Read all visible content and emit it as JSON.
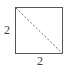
{
  "figure": {
    "name": "square-with-diagonal",
    "background_color": "#ffffff",
    "shape": {
      "type": "square",
      "stroke_color": "#555555",
      "stroke_width": 1,
      "fill": "none",
      "left": 15,
      "top": 7,
      "side_px": 47
    },
    "diagonal": {
      "type": "line",
      "style": "dashed",
      "from": "top-left-corner",
      "to": "bottom-right-corner",
      "stroke_color": "#6b6b6b",
      "stroke_width": 1,
      "dash_pattern": "2 2"
    },
    "labels": {
      "left": "2",
      "bottom": "2",
      "text_color": "#3c3c3c"
    }
  }
}
